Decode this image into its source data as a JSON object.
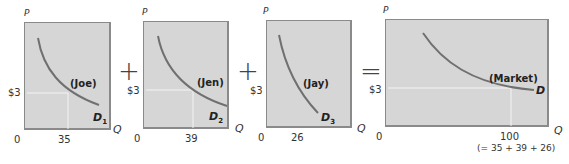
{
  "operators": {
    "plus1": "+",
    "plus2": "+",
    "equals": "="
  },
  "panels": [
    {
      "id": "joe",
      "name": "(Joe)",
      "curve_label": "D",
      "curve_sub": "1",
      "price_label": "$3",
      "origin": "0",
      "q_value": "35",
      "p_axis": "P",
      "q_axis": "Q"
    },
    {
      "id": "jen",
      "name": "(Jen)",
      "curve_label": "D",
      "curve_sub": "2",
      "price_label": "$3",
      "origin": "0",
      "q_value": "39",
      "p_axis": "P",
      "q_axis": "Q"
    },
    {
      "id": "jay",
      "name": "(Jay)",
      "curve_label": "D",
      "curve_sub": "3",
      "price_label": "$3",
      "origin": "0",
      "q_value": "26",
      "p_axis": "P",
      "q_axis": "Q"
    },
    {
      "id": "market",
      "name": "(Market)",
      "curve_label": "D",
      "curve_sub": "",
      "price_label": "$3",
      "origin": "0",
      "q_value": "100",
      "q_note": "(= 35 + 39 + 26)",
      "p_axis": "P",
      "q_axis": "Q"
    }
  ],
  "colors": {
    "panel_bg": "#d6d6d6",
    "curve": "#707070",
    "guide": "#f4f4f4",
    "border": "#8a8a8a"
  }
}
